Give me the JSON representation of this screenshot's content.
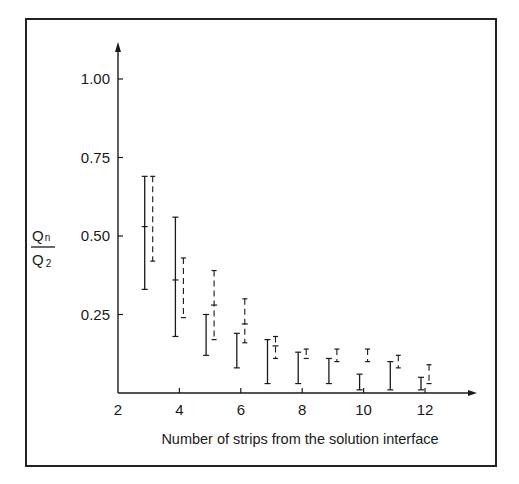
{
  "chart_data": {
    "type": "errorbar",
    "title": "",
    "xlabel": "Number of strips from the solution interface",
    "ylabel": "Qn/Q2",
    "ylabel_parts": {
      "num": "Q",
      "num_sub": "n",
      "den": "Q",
      "den_sub": "2"
    },
    "xlim": [
      2,
      13.5
    ],
    "ylim": [
      0,
      1.1
    ],
    "x_ticks": [
      2,
      4,
      6,
      8,
      10,
      12
    ],
    "x_tick_labels": [
      "2",
      "4",
      "6",
      "8",
      "10",
      "12"
    ],
    "y_ticks": [
      0.25,
      0.5,
      0.75,
      1.0
    ],
    "y_tick_labels": [
      "0.25",
      "0.50",
      "0.75",
      "1.00"
    ],
    "grid": false,
    "legend": null,
    "series": [
      {
        "name": "solid",
        "style": "solid",
        "points": [
          {
            "x": 3,
            "low": 0.33,
            "high": 0.69,
            "mid": 0.53
          },
          {
            "x": 4,
            "low": 0.18,
            "high": 0.56,
            "mid": 0.36
          },
          {
            "x": 5,
            "low": 0.12,
            "high": 0.25,
            "mid": null
          },
          {
            "x": 6,
            "low": 0.08,
            "high": 0.19,
            "mid": null
          },
          {
            "x": 7,
            "low": 0.03,
            "high": 0.17,
            "mid": null
          },
          {
            "x": 8,
            "low": 0.03,
            "high": 0.13,
            "mid": null
          },
          {
            "x": 9,
            "low": 0.03,
            "high": 0.11,
            "mid": null
          },
          {
            "x": 10,
            "low": 0.01,
            "high": 0.06,
            "mid": null
          },
          {
            "x": 11,
            "low": 0.01,
            "high": 0.1,
            "mid": null
          },
          {
            "x": 12,
            "low": 0.01,
            "high": 0.05,
            "mid": null
          }
        ]
      },
      {
        "name": "dashed",
        "style": "dashed",
        "points": [
          {
            "x": 3,
            "low": 0.42,
            "high": 0.69,
            "mid": null
          },
          {
            "x": 4,
            "low": 0.24,
            "high": 0.43,
            "mid": null
          },
          {
            "x": 5,
            "low": 0.17,
            "high": 0.39,
            "mid": 0.28
          },
          {
            "x": 6,
            "low": 0.16,
            "high": 0.3,
            "mid": 0.22
          },
          {
            "x": 7,
            "low": 0.11,
            "high": 0.18,
            "mid": 0.15
          },
          {
            "x": 8,
            "low": 0.11,
            "high": 0.14,
            "mid": null
          },
          {
            "x": 9,
            "low": 0.1,
            "high": 0.14,
            "mid": null
          },
          {
            "x": 10,
            "low": 0.1,
            "high": 0.14,
            "mid": null
          },
          {
            "x": 11,
            "low": 0.08,
            "high": 0.12,
            "mid": null
          },
          {
            "x": 12,
            "low": 0.03,
            "high": 0.09,
            "mid": null
          }
        ]
      }
    ],
    "colors": {
      "ink": "#1a1a1a",
      "background": "#ffffff"
    }
  }
}
